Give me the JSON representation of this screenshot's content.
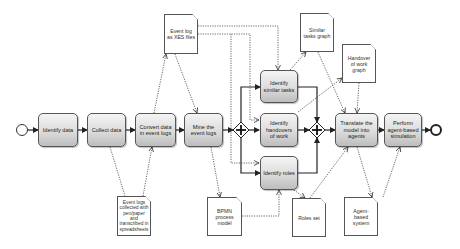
{
  "diagram": {
    "type": "BPMN process",
    "colors": {
      "task_fill_top": "#f4f4f4",
      "task_fill_bottom": "#bdbdbd",
      "stroke": "#333333",
      "background": "#ffffff"
    },
    "events": {
      "start": {
        "name": "start-event"
      },
      "end": {
        "name": "end-event"
      }
    },
    "tasks": [
      {
        "id": "identify-data",
        "label": "Identify data"
      },
      {
        "id": "collect-data",
        "label": "Collect data"
      },
      {
        "id": "convert-data",
        "label": "Convert data in event logs"
      },
      {
        "id": "mine-logs",
        "label": "Mine the event logs"
      },
      {
        "id": "identify-similar",
        "label": "Identify similar tasks"
      },
      {
        "id": "identify-handovers",
        "label": "Identify handovers of work"
      },
      {
        "id": "identify-roles",
        "label": "Identify roles"
      },
      {
        "id": "translate-model",
        "label": "Translate the model into agents"
      },
      {
        "id": "perform-simulation",
        "label": "Perform agent-based simulation"
      }
    ],
    "gateways": [
      {
        "id": "split",
        "type": "parallel",
        "symbol": "+"
      },
      {
        "id": "join",
        "type": "parallel",
        "symbol": "+"
      }
    ],
    "documents": [
      {
        "id": "xes-log",
        "label": "Event log as XES files"
      },
      {
        "id": "paper-logs",
        "label": "Event logs collected with pen/paper and transcribed in spreadsheets"
      },
      {
        "id": "bpmn-model",
        "label": "BPMN process model"
      },
      {
        "id": "similar-graph",
        "label": "Similar tasks graph"
      },
      {
        "id": "handover-graph",
        "label": "Handover of work graph"
      },
      {
        "id": "roles-set",
        "label": "Roles set"
      },
      {
        "id": "abs-system",
        "label": "Agent-based system"
      }
    ]
  }
}
